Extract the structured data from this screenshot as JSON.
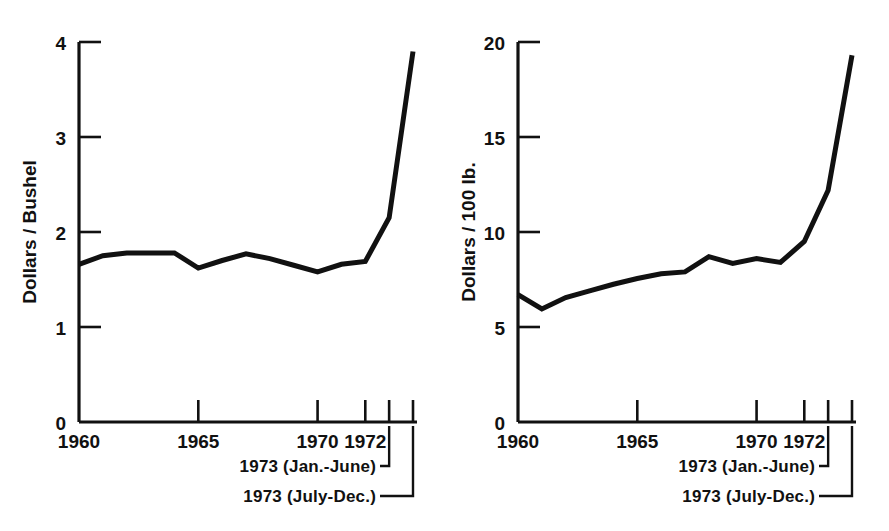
{
  "figure": {
    "background": "#ffffff",
    "line_color": "#111111",
    "axis_color": "#111111"
  },
  "panels": [
    {
      "id": "left",
      "y_axis_label": "Dollars / Bushel",
      "y_ticks": [
        "0",
        "1",
        "2",
        "3",
        "4"
      ],
      "x_ticks": [
        "1960",
        "1965",
        "1970",
        "1972"
      ],
      "annotations": [
        "1973 (Jan.-June)",
        "1973 (July-Dec.)"
      ]
    },
    {
      "id": "right",
      "y_axis_label": "Dollars / 100 lb.",
      "y_ticks": [
        "0",
        "5",
        "10",
        "15",
        "20"
      ],
      "x_ticks": [
        "1960",
        "1965",
        "1970",
        "1972"
      ],
      "annotations": [
        "1973 (Jan.-June)",
        "1973 (July-Dec.)"
      ]
    }
  ],
  "chart_data": [
    {
      "type": "line",
      "title": "",
      "xlabel": "",
      "ylabel": "Dollars / Bushel",
      "ylim": [
        0,
        4
      ],
      "yticks": [
        0,
        1,
        2,
        3,
        4
      ],
      "xticks_labeled": [
        1960,
        1965,
        1970,
        1972
      ],
      "grid": false,
      "legend": "none",
      "x": [
        "1960",
        "1961",
        "1962",
        "1963",
        "1964",
        "1965",
        "1966",
        "1967",
        "1968",
        "1969",
        "1970",
        "1971",
        "1972",
        "1973 (Jan.-June)",
        "1973 (July-Dec.)"
      ],
      "values": [
        1.66,
        1.75,
        1.78,
        1.78,
        1.78,
        1.62,
        1.7,
        1.77,
        1.72,
        1.65,
        1.58,
        1.66,
        1.69,
        2.15,
        3.9
      ]
    },
    {
      "type": "line",
      "title": "",
      "xlabel": "",
      "ylabel": "Dollars / 100 lb.",
      "ylim": [
        0,
        20
      ],
      "yticks": [
        0,
        5,
        10,
        15,
        20
      ],
      "xticks_labeled": [
        1960,
        1965,
        1970,
        1972
      ],
      "grid": false,
      "legend": "none",
      "x": [
        "1960",
        "1961",
        "1962",
        "1963",
        "1964",
        "1965",
        "1966",
        "1967",
        "1968",
        "1969",
        "1970",
        "1971",
        "1972",
        "1973 (Jan.-June)",
        "1973 (July-Dec.)"
      ],
      "values": [
        6.7,
        5.95,
        6.55,
        6.9,
        7.25,
        7.55,
        7.8,
        7.9,
        8.7,
        8.35,
        8.6,
        8.4,
        9.5,
        12.2,
        19.3
      ]
    }
  ]
}
